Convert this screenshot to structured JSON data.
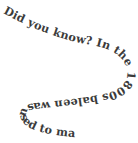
{
  "canvas": {
    "width": 138,
    "height": 143,
    "background_color": "#ffffff"
  },
  "curved_text": {
    "full_text": "Did you know? In the 1800s baleen was used to make umbrellas.",
    "text_color": "#3b3b3b",
    "segments": [
      {
        "id": "seg-1",
        "text": "Did you know?"
      },
      {
        "id": "seg-2",
        "text": " In the 1800s"
      },
      {
        "id": "seg-3",
        "text": " baleen was used to"
      },
      {
        "id": "seg-4",
        "text": " make umbrellas."
      }
    ],
    "shape": "horseshoe-spiral",
    "reading_direction": "clockwise"
  }
}
